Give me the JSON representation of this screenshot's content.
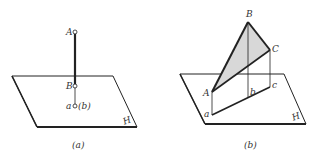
{
  "figure_a": {
    "caption": "(a)",
    "plane_label": "H",
    "points": {
      "A": "A",
      "B": "B",
      "ab": "a",
      "ab_paren": "(b)"
    }
  },
  "figure_b": {
    "caption": "(b)",
    "plane_label": "H",
    "points": {
      "A": "A",
      "B": "B",
      "C": "C",
      "a": "a",
      "b": "b",
      "c": "c"
    }
  },
  "colors": {
    "line": "#222222",
    "fill": "#d8d8d8"
  }
}
